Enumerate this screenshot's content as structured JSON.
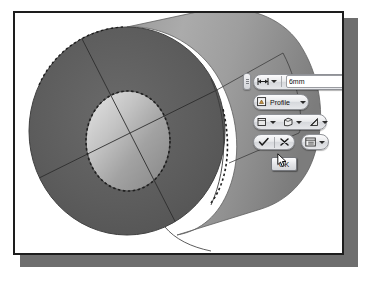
{
  "app": {
    "type": "cad-extrude-mini-toolbar",
    "canvas_background": "#ffffff",
    "frame_border_color": "#1d1d1d",
    "shadow_color": "#6e6e6e"
  },
  "model": {
    "name": "ring-tube-solid",
    "description": "Isometric thick-walled cylinder (tube/ring) with circular bore",
    "face_color_front": "#5c5c5c",
    "face_color_body": "#8a8a8a",
    "body_highlight": "#a6a6a6",
    "bore_color": "#9b9b9b",
    "bore_highlight": "#cfcfcf",
    "edge_color": "#3a3a3a",
    "leader_line_color": "#4a4a4a"
  },
  "toolbar": {
    "grip_label": "drag-grip",
    "row_distance": {
      "extent_icon": "extent-distance-icon",
      "extent_dropdown": "chevron-down-icon",
      "value": "6mm",
      "placeholder": "6mm",
      "spin_icon": "chevron-right-icon"
    },
    "row_profile": {
      "icon": "profile-sketch-icon",
      "label": "Profile",
      "dropdown": "chevron-down-icon"
    },
    "row_options": {
      "buttons": [
        {
          "icon": "solid-body-icon",
          "dropdown": "chevron-down-icon"
        },
        {
          "icon": "boolean-join-icon",
          "dropdown": "chevron-down-icon"
        },
        {
          "icon": "taper-angle-icon",
          "dropdown": "chevron-down-icon"
        }
      ]
    },
    "row_actions": {
      "apply_icon": "checkmark-icon",
      "cancel_icon": "close-x-icon",
      "more_icon": "options-list-icon",
      "more_dropdown": "chevron-down-icon"
    },
    "ok_button": {
      "label": "OK"
    }
  },
  "pointer": {
    "name": "mouse-cursor",
    "x": 262,
    "y": 140
  }
}
